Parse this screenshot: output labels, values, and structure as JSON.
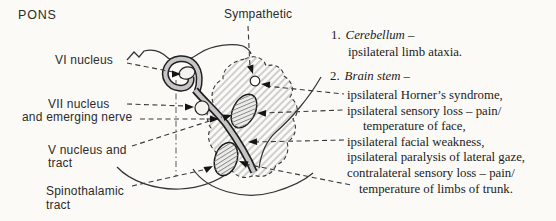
{
  "figure": {
    "title": "PONS",
    "anatomy_labels": {
      "sympathetic": "Sympathetic",
      "vi_nucleus": "VI nucleus",
      "vii_nucleus_line1": "VII nucleus",
      "vii_nucleus_line2": "and emerging nerve",
      "v_nucleus_line1": "V nucleus and",
      "v_nucleus_line2": "tract",
      "spinothalamic_line1": "Spinothalamic",
      "spinothalamic_line2": "tract"
    },
    "findings": [
      {
        "number": "1.",
        "structure": "Cerebellum –",
        "effects": [
          "ipsilateral limb ataxia."
        ]
      },
      {
        "number": "2.",
        "structure": "Brain stem –",
        "effects": [
          "ipsilateral Horner’s syndrome,",
          "ipsilateral sensory loss – pain/",
          "temperature of face,",
          "ipsilateral facial weakness,",
          "ipsilateral paralysis of lateral gaze,",
          "contralateral sensory loss – pain/",
          "temperature of limbs of trunk."
        ]
      }
    ],
    "colors": {
      "ink": "#2b2b2b",
      "paper": "#fbfaf7",
      "nerve_band": "#c6c6c6",
      "hatch": "#9a9a9a"
    }
  }
}
